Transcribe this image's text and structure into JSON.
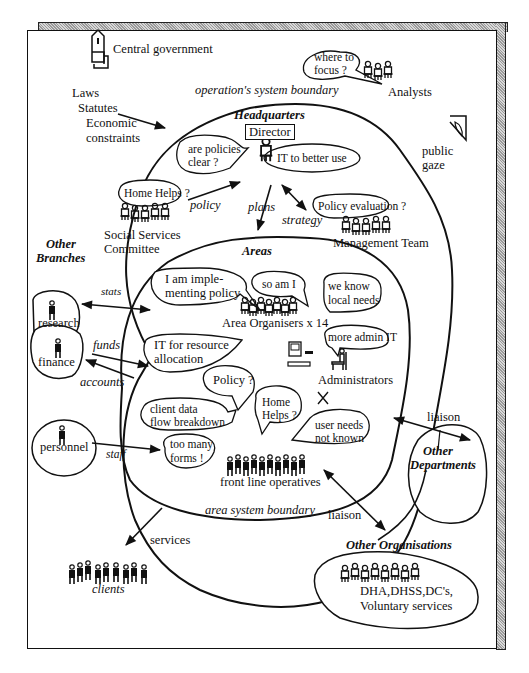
{
  "diagram": {
    "type": "rich-picture",
    "colors": {
      "ink": "#111111",
      "paper": "#ffffff",
      "shadow": "#b0b0b0"
    },
    "environment": {
      "central_government": "Central government",
      "constraints": [
        "Laws",
        "Statutes",
        "Economic",
        "constraints"
      ],
      "analysts": {
        "label": "Analysts",
        "bubble": [
          "where to",
          "focus ?"
        ]
      },
      "public_gaze": [
        "public",
        "gaze"
      ],
      "clients": "clients",
      "services": "services"
    },
    "boundaries": {
      "operations": "operation's system boundary",
      "area": "area  system boundary"
    },
    "headquarters": {
      "title": "Headquarters",
      "director": "Director",
      "bubbles": {
        "policies_clear": [
          "are policies",
          "clear ?"
        ],
        "it_better_use": "IT to better use",
        "home_helps": "Home Helps ?",
        "policy_evaluation": "Policy evaluation ?"
      },
      "committee": [
        "Social Services",
        "Committee"
      ],
      "management_team": "Management Team",
      "arrows": {
        "policy": "policy",
        "plans": "plans",
        "strategy": "strategy"
      }
    },
    "other_branches": {
      "title": [
        "Other",
        "Branches"
      ],
      "research": "research",
      "finance": "finance",
      "personnel": "personnel",
      "arrows": {
        "stats": "stats",
        "funds": "funds",
        "accounts": "accounts",
        "staff": "staff"
      }
    },
    "areas": {
      "title": "Areas",
      "area_organisers": "Area Organisers x 14",
      "administrators": "Administrators",
      "front_line": "front line operatives",
      "bubbles": {
        "implementing": [
          "I am imple-",
          "menting policy"
        ],
        "so_am_i": "so am I",
        "local_needs": [
          "we know",
          "local needs"
        ],
        "more_admin_it": "more admin IT",
        "it_resource": [
          "IT for resource",
          "allocation"
        ],
        "policy_q": "Policy ?",
        "home_helps": [
          "Home",
          "Helps ?"
        ],
        "client_data": [
          "client data",
          "flow breakdown"
        ],
        "user_needs": [
          "user needs",
          "not known"
        ],
        "too_many_forms": [
          "too many",
          "forms !"
        ]
      },
      "conflict_mark": "X"
    },
    "other_departments": {
      "title": [
        "Other",
        "Departments"
      ],
      "liaison": "liaison"
    },
    "other_organisations": {
      "title": "Other Organisations",
      "members": [
        "DHA,DHSS,DC's,",
        "Voluntary services"
      ],
      "liaison": "liaison"
    }
  }
}
